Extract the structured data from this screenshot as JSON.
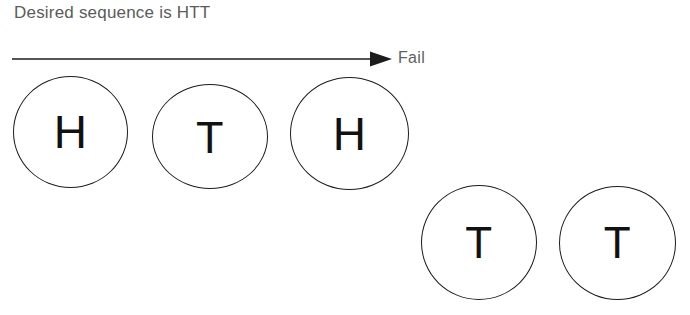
{
  "figure": {
    "caption": "Desired sequence is HTT",
    "outcome_label": "Fail"
  },
  "arrow": {
    "name": "progress-arrow",
    "direction": "right",
    "color": "#1c1c1c",
    "x_start": 12,
    "x_end": 392,
    "y": 59
  },
  "coins": [
    {
      "face": "H",
      "row": "top",
      "index": 1
    },
    {
      "face": "T",
      "row": "top",
      "index": 2
    },
    {
      "face": "H",
      "row": "top",
      "index": 3
    },
    {
      "face": "T",
      "row": "bottom",
      "index": 4
    },
    {
      "face": "T",
      "row": "bottom",
      "index": 5
    }
  ],
  "colors": {
    "caption_text": "#5b5b5b",
    "label_text": "#5f5f5f",
    "circle_stroke": "#1c1c1c",
    "face_text": "#111111",
    "background": "#ffffff"
  }
}
